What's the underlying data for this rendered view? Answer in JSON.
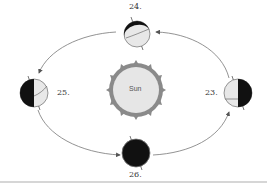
{
  "diagram": {
    "sun": {
      "label": "Sun",
      "fill": "#e6e6e6",
      "corona": "#777777"
    },
    "orbit_direction": "counterclockwise",
    "positions": [
      {
        "number": "23.",
        "location": "right",
        "lit_side": "left",
        "dark_side": "right"
      },
      {
        "number": "24.",
        "location": "top",
        "lit_side": "mostly lit",
        "dark_side": "thin crescent top-left"
      },
      {
        "number": "25.",
        "location": "left",
        "lit_side": "right",
        "dark_side": "left"
      },
      {
        "number": "26.",
        "location": "bottom",
        "lit_side": "none visible",
        "dark_side": "fully dark"
      }
    ],
    "colors": {
      "dark": "#111111",
      "light": "#e8e8e8",
      "line": "#666666",
      "divider": "#d6d6d6"
    }
  }
}
